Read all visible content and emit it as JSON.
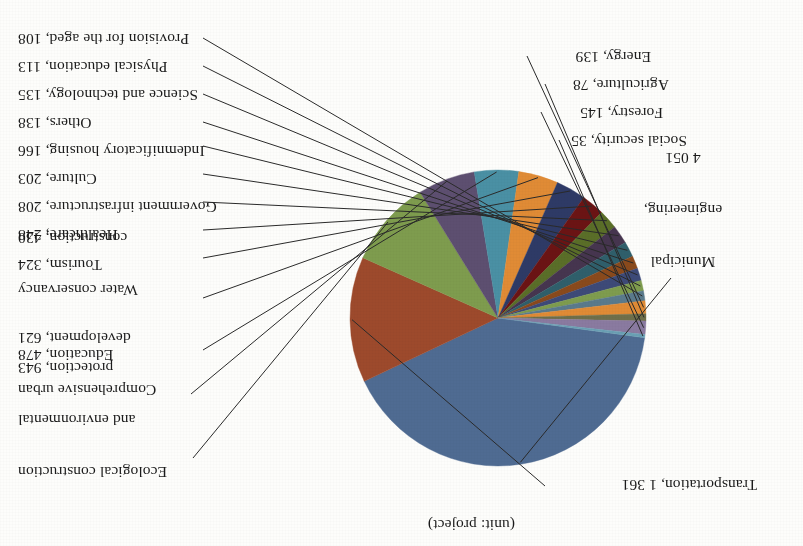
{
  "unit_note": "(unit: project)",
  "chart_data": {
    "type": "pie",
    "title": "",
    "subtitle": "(unit: project)",
    "xlabel": "",
    "ylabel": "",
    "unit": "project",
    "legend_position": "none",
    "grid": false,
    "labels_show_value": true,
    "rotated_180": true,
    "categories": [
      "Municipal engineering",
      "Transportation",
      "Ecological construction and environmental protection",
      "Comprehensive urban development",
      "Education",
      "Water conservancy construction",
      "Tourism",
      "Healthcare",
      "Government infrastructure",
      "Culture",
      "Indemnificatory housing",
      "Others",
      "Science and technology",
      "Physical education",
      "Provision for the aged",
      "Energy",
      "Agriculture",
      "Forestry",
      "Social security"
    ],
    "values": [
      4051,
      1361,
      943,
      621,
      478,
      430,
      324,
      248,
      208,
      203,
      166,
      138,
      135,
      113,
      108,
      139,
      78,
      145,
      35
    ],
    "value_labels": [
      "4 051",
      "1 361",
      "943",
      "621",
      "478",
      "430",
      "324",
      "248",
      "208",
      "203",
      "166",
      "138",
      "135",
      "113",
      "108",
      "139",
      "78",
      "145",
      "35"
    ],
    "colors": [
      "#4f6b92",
      "#9d4a2c",
      "#7e9c4e",
      "#5d4f70",
      "#4a90a4",
      "#e08b35",
      "#2e3a66",
      "#6b1414",
      "#5a6e28",
      "#46354f",
      "#2f5f6b",
      "#8a4a1c",
      "#3d4a78",
      "#7e9c4e",
      "#5a7a8c",
      "#e08b35",
      "#6f6f4a",
      "#8a7aa0",
      "#6aa0b4"
    ]
  },
  "slices": [
    {
      "name": "Municipal engineering",
      "label_line1": "Municipal",
      "label_line2": "engineering,",
      "label_line3": "4 051",
      "value": 4051,
      "value_text": "4 051",
      "color": "#4f6b92"
    },
    {
      "name": "Transportation",
      "label": "Transportation, 1 361",
      "value": 1361,
      "value_text": "1 361",
      "color": "#9d4a2c"
    },
    {
      "name": "Ecological construction and environmental protection",
      "label_line1": "Ecological construction",
      "label_line2": "and environmental",
      "label_line3": "protection, 943",
      "value": 943,
      "value_text": "943",
      "color": "#7e9c4e"
    },
    {
      "name": "Comprehensive urban development",
      "label_line1": "Comprehensive urban",
      "label_line2": "development, 621",
      "value": 621,
      "value_text": "621",
      "color": "#5d4f70"
    },
    {
      "name": "Education",
      "label": "Education, 478",
      "value": 478,
      "value_text": "478",
      "color": "#4a90a4"
    },
    {
      "name": "Water conservancy construction",
      "label_line1": "Water conservancy",
      "label_line2": "construction, 430",
      "value": 430,
      "value_text": "430",
      "color": "#e08b35"
    },
    {
      "name": "Tourism",
      "label": "Tourism, 324",
      "value": 324,
      "value_text": "324",
      "color": "#2e3a66"
    },
    {
      "name": "Healthcare",
      "label": "Healthcare, 248",
      "value": 248,
      "value_text": "248",
      "color": "#6b1414"
    },
    {
      "name": "Government infrastructure",
      "label": "Government infrastructure, 208",
      "value": 208,
      "value_text": "208",
      "color": "#5a6e28"
    },
    {
      "name": "Culture",
      "label": "Culture, 203",
      "value": 203,
      "value_text": "203",
      "color": "#46354f"
    },
    {
      "name": "Indemnificatory housing",
      "label": "Indemnificatory housing, 166",
      "value": 166,
      "value_text": "166",
      "color": "#2f5f6b"
    },
    {
      "name": "Others",
      "label": "Others, 138",
      "value": 138,
      "value_text": "138",
      "color": "#8a4a1c"
    },
    {
      "name": "Science and technology",
      "label": "Science and technology, 135",
      "value": 135,
      "value_text": "135",
      "color": "#3d4a78"
    },
    {
      "name": "Physical education",
      "label": "Physical education, 113",
      "value": 113,
      "value_text": "113",
      "color": "#7e9c4e"
    },
    {
      "name": "Provision for the aged",
      "label": "Provision for the aged, 108",
      "value": 108,
      "value_text": "108",
      "color": "#5a7a8c"
    },
    {
      "name": "Energy",
      "label": "Energy, 139",
      "value": 139,
      "value_text": "139",
      "color": "#e08b35"
    },
    {
      "name": "Agriculture",
      "label": "Agriculture, 78",
      "value": 78,
      "value_text": "78",
      "color": "#6f6f4a"
    },
    {
      "name": "Forestry",
      "label": "Forestry, 145",
      "value": 145,
      "value_text": "145",
      "color": "#8a7aa0"
    },
    {
      "name": "Social security",
      "label": "Social security, 35",
      "value": 35,
      "value_text": "35",
      "color": "#6aa0b4"
    }
  ]
}
